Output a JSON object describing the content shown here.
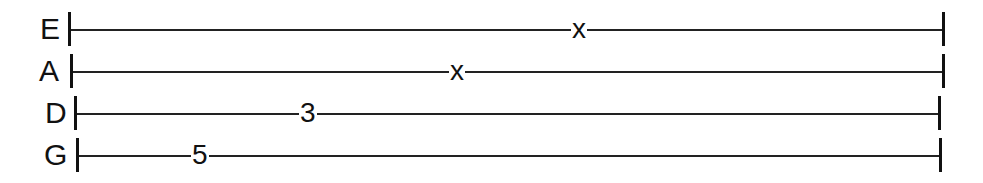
{
  "tab": {
    "instrument": "bass",
    "strings": [
      {
        "name": "E",
        "y": 30,
        "label_x": 40,
        "left_bar_x": 68,
        "right_bar_x": 942,
        "notes": [
          {
            "fret": "x",
            "x": 571
          }
        ]
      },
      {
        "name": "A",
        "y": 72,
        "label_x": 39,
        "left_bar_x": 70,
        "right_bar_x": 942,
        "notes": [
          {
            "fret": "x",
            "x": 449
          }
        ]
      },
      {
        "name": "D",
        "y": 114,
        "label_x": 45,
        "left_bar_x": 74,
        "right_bar_x": 938,
        "notes": [
          {
            "fret": "3",
            "x": 299
          }
        ]
      },
      {
        "name": "G",
        "y": 156,
        "label_x": 44,
        "left_bar_x": 76,
        "right_bar_x": 939,
        "notes": [
          {
            "fret": "5",
            "x": 191
          }
        ]
      }
    ]
  }
}
